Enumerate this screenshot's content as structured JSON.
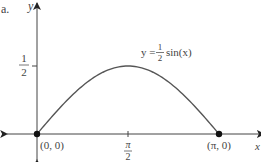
{
  "figure_label": "a.",
  "chart_data": {
    "type": "line",
    "title": "",
    "function_label": {
      "lhs": "y =",
      "frac_num": "1",
      "frac_den": "2",
      "rhs": "sin(x)"
    },
    "xlabel": "x",
    "ylabel": "y",
    "xlim": [
      -0.55,
      3.95
    ],
    "ylim": [
      -0.45,
      0.95
    ],
    "x_ticks": [
      {
        "value": 1.5708,
        "num": "π",
        "den": "2"
      }
    ],
    "y_ticks": [
      {
        "value": 0.5,
        "num": "1",
        "den": "2"
      }
    ],
    "series": [
      {
        "name": "y = (1/2) sin(x)",
        "domain": [
          0,
          3.14159
        ],
        "x": [
          0,
          0.3927,
          0.7854,
          1.1781,
          1.5708,
          1.9635,
          2.3562,
          2.7489,
          3.14159
        ],
        "y": [
          0,
          0.1913,
          0.3536,
          0.4619,
          0.5,
          0.4619,
          0.3536,
          0.1913,
          0
        ]
      }
    ],
    "points": [
      {
        "x": 0,
        "y": 0,
        "label": "(0, 0)"
      },
      {
        "x": 3.14159,
        "y": 0,
        "label": "(π, 0)"
      }
    ],
    "grid": false,
    "legend": "none"
  }
}
